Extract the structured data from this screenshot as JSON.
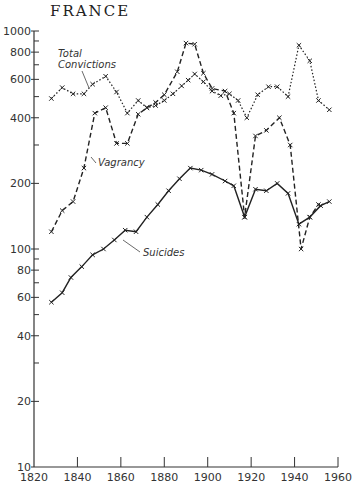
{
  "title": "FRANCE",
  "chart_data": {
    "type": "line",
    "title": "FRANCE",
    "xlabel": "",
    "ylabel": "",
    "yscale": "log",
    "xlim": [
      1820,
      1960
    ],
    "ylim": [
      10,
      1000
    ],
    "grid": false,
    "x_ticks": [
      "1820",
      "1840",
      "1860",
      "1880",
      "1900",
      "1920",
      "1940",
      "1960"
    ],
    "y_ticks": [
      "10",
      "20",
      "40",
      "60",
      "80",
      "100",
      "200",
      "400",
      "600",
      "800",
      "1000"
    ],
    "series": [
      {
        "name": "Total Convictions",
        "style": "dotted",
        "x": [
          1828,
          1833,
          1838,
          1843,
          1847,
          1853,
          1858,
          1863,
          1868,
          1872,
          1876,
          1880,
          1884,
          1888,
          1891,
          1894,
          1898,
          1902,
          1906,
          1910,
          1914,
          1918,
          1923,
          1928,
          1932,
          1937,
          1942,
          1947,
          1951,
          1956
        ],
        "values": [
          490,
          550,
          515,
          515,
          570,
          620,
          525,
          420,
          480,
          445,
          455,
          480,
          515,
          560,
          595,
          635,
          585,
          530,
          505,
          515,
          480,
          400,
          510,
          555,
          555,
          500,
          860,
          730,
          480,
          435
        ]
      },
      {
        "name": "Vagrancy",
        "style": "dashed",
        "x": [
          1828,
          1833,
          1838,
          1843,
          1848,
          1853,
          1858,
          1863,
          1868,
          1872,
          1876,
          1880,
          1886,
          1890,
          1894,
          1898,
          1902,
          1908,
          1912,
          1917,
          1922,
          1927,
          1933,
          1938,
          1943,
          1947,
          1951
        ],
        "values": [
          120,
          150,
          165,
          235,
          420,
          445,
          305,
          305,
          415,
          445,
          470,
          510,
          650,
          880,
          870,
          640,
          545,
          530,
          420,
          140,
          330,
          350,
          400,
          300,
          100,
          140,
          160
        ]
      },
      {
        "name": "Suicides",
        "style": "solid",
        "x": [
          1828,
          1833,
          1837,
          1842,
          1847,
          1852,
          1857,
          1862,
          1867,
          1872,
          1877,
          1882,
          1887,
          1892,
          1897,
          1902,
          1908,
          1912,
          1917,
          1922,
          1927,
          1932,
          1937,
          1942,
          1947,
          1952,
          1956
        ],
        "values": [
          57,
          63,
          74,
          83,
          94,
          100,
          110,
          122,
          120,
          140,
          160,
          185,
          210,
          235,
          230,
          220,
          205,
          195,
          140,
          188,
          185,
          200,
          180,
          130,
          140,
          158,
          165
        ]
      }
    ],
    "annotations": [
      {
        "text": "Total Convictions",
        "target": "Total Convictions"
      },
      {
        "text": "Vagrancy",
        "target": "Vagrancy"
      },
      {
        "text": "Suicides",
        "target": "Suicides"
      }
    ]
  }
}
